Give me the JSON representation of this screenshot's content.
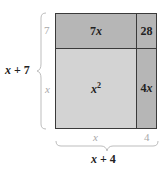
{
  "diagram": {
    "type": "area-model",
    "colors": {
      "light_region": "#d3d3d3",
      "dark_region": "#b6b6b6",
      "border": "#3a3a3a",
      "dim_label": "#a8a8a8",
      "brace": "#bdbdbd"
    },
    "regions": [
      {
        "id": "top-left",
        "label": "7x",
        "var": "x",
        "coef": "7"
      },
      {
        "id": "top-right",
        "label": "28"
      },
      {
        "id": "bottom-left",
        "label": "x²",
        "base": "x",
        "exp": "2"
      },
      {
        "id": "bottom-right",
        "label": "4x",
        "coef": "4",
        "var": "x"
      }
    ],
    "left_dimensions": {
      "top": "7",
      "bottom": "x",
      "total_var": "x",
      "total_rest": " + 7"
    },
    "bottom_dimensions": {
      "left": "x",
      "right": "4",
      "total_var": "x",
      "total_rest": " + 4"
    }
  }
}
